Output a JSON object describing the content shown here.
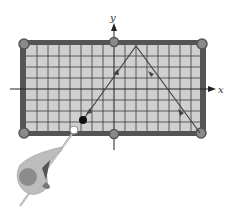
{
  "figure": {
    "axes": {
      "x_label": "x",
      "y_label": "y"
    },
    "grid": {
      "cols": 16,
      "rows": 8
    },
    "colors": {
      "felt": "#cfcfcf",
      "grid_line": "#3a3a3a",
      "rail": "#555555",
      "pocket": "#8a8a8a",
      "cue_ball": "#ffffff",
      "object_ball": "#111111",
      "path": "#444444",
      "player_body": "#bdbdbd",
      "player_head": "#8c8c8c"
    },
    "path_points": [
      {
        "label": "object-ball",
        "x": 83,
        "y": 120
      },
      {
        "label": "bounce-top-rail",
        "x": 136,
        "y": 46
      },
      {
        "label": "corner-pocket-bottom-right",
        "x": 200,
        "y": 133
      }
    ]
  }
}
